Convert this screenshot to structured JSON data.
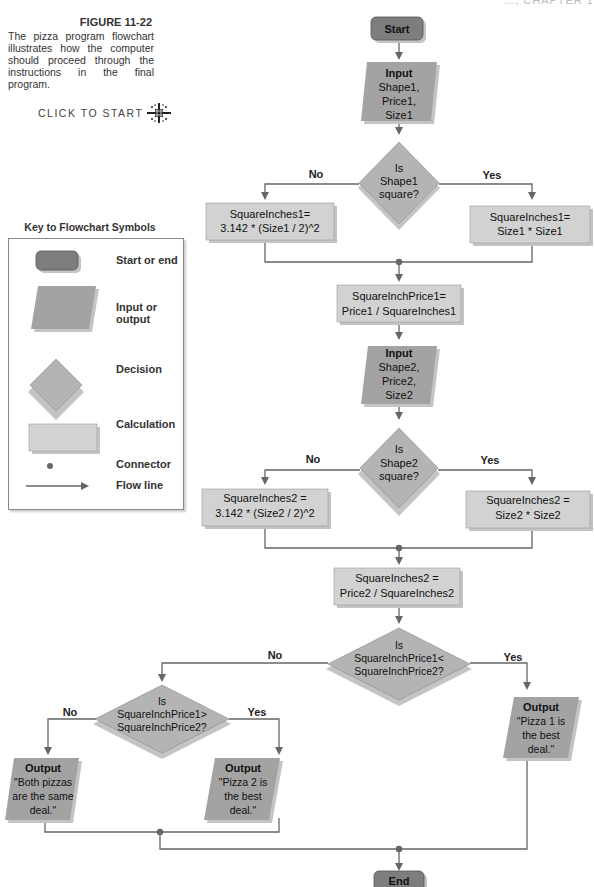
{
  "header_fragment": "…, CHAPTER 1",
  "figure": {
    "title": "FIGURE 11-22",
    "caption_lines": [
      "The pizza program flowchart",
      "illustrates how the computer",
      "should proceed through the",
      "instructions in the final program."
    ],
    "click_to_start": "CLICK TO START",
    "click_icon": "sparkle-icon"
  },
  "key": {
    "title": "Key to Flowchart Symbols",
    "items": [
      {
        "symbol": "terminal",
        "label": "Start or end"
      },
      {
        "symbol": "parallelogram",
        "label": "Input or output"
      },
      {
        "symbol": "diamond",
        "label": "Decision"
      },
      {
        "symbol": "rectangle",
        "label": "Calculation"
      },
      {
        "symbol": "dot",
        "label": "Connector"
      },
      {
        "symbol": "arrow",
        "label": "Flow line"
      }
    ]
  },
  "colors": {
    "terminal": "#7d7d7d",
    "io": "#a3a3a3",
    "decision": "#b4b4b4",
    "calc": "#d2d2d2",
    "line": "#666666",
    "shadow": "#c4c4c4"
  },
  "flow": {
    "start": "Start",
    "input1": [
      "Input",
      "Shape1,",
      "Price1,",
      "Size1"
    ],
    "decision1": [
      "Is",
      "Shape1",
      "square?"
    ],
    "d1_no": "No",
    "d1_yes": "Yes",
    "calc1_no": [
      "SquareInches1=",
      "3.142 * (Size1 / 2)^2"
    ],
    "calc1_yes": [
      "SquareInches1=",
      "Size1 * Size1"
    ],
    "price1": [
      "SquareInchPrice1=",
      "Price1 / SquareInches1"
    ],
    "input2": [
      "Input",
      "Shape2,",
      "Price2,",
      "Size2"
    ],
    "decision2": [
      "Is",
      "Shape2",
      "square?"
    ],
    "d2_no": "No",
    "d2_yes": "Yes",
    "calc2_no": [
      "SquareInches2 =",
      "3.142 * (Size2 / 2)^2"
    ],
    "calc2_yes": [
      "SquareInches2 =",
      "Size2 * Size2"
    ],
    "price2": [
      "SquareInches2 =",
      "Price2 / SquareInches2"
    ],
    "decision3": [
      "Is",
      "SquareInchPrice1<",
      "SquareInchPrice2?"
    ],
    "d3_no": "No",
    "d3_yes": "Yes",
    "decision4": [
      "Is",
      "SquareInchPrice1>",
      "SquareInchPrice2?"
    ],
    "d4_no": "No",
    "d4_yes": "Yes",
    "out_same": [
      "Output",
      "\"Both pizzas",
      "are the same",
      "deal.\""
    ],
    "out_p2": [
      "Output",
      "\"Pizza 2 is",
      "the best",
      "deal.\""
    ],
    "out_p1": [
      "Output",
      "\"Pizza 1 is",
      "the best",
      "deal.\""
    ],
    "end": "End"
  }
}
